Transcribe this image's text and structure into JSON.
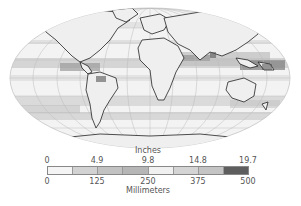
{
  "map": {
    "projection": "mollweide-like",
    "subject": "global precipitation"
  },
  "legend": {
    "top_unit": "Inches",
    "bottom_unit": "Millimeters",
    "inch_ticks": [
      "0",
      "4.9",
      "9.8",
      "14.8",
      "19.7"
    ],
    "mm_ticks": [
      "0",
      "125",
      "250",
      "375",
      "500"
    ],
    "segment_colors": [
      "#f4f4f4",
      "#d2d2d2",
      "#c2c2c2",
      "#b6b6b6",
      "#f0f0f0",
      "#d4d4d4",
      "#c4c4c4",
      "#5e5e5e"
    ]
  }
}
